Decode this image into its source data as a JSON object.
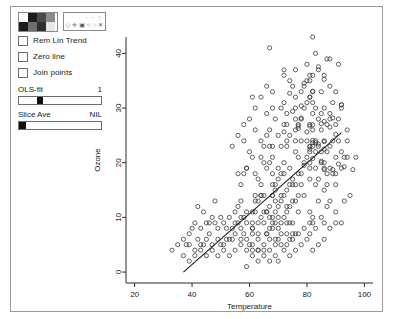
{
  "window": {
    "title": ""
  },
  "controls": {
    "color_palette": {
      "name": "color-palette",
      "swatches": [
        "#ffffff",
        "#1c1c1c",
        "#4a4a4a",
        "#8c8c8c",
        "#1c1c1c",
        "#6e6e6e",
        "#2f2f2f",
        "#e8e8e8"
      ]
    },
    "symbol_palette": {
      "name": "symbol-palette",
      "row_top": [
        "·",
        "·",
        "·",
        "+",
        "•",
        "◻"
      ],
      "row_bottom": [
        "◇",
        "✛",
        "▣",
        "○",
        "◌",
        "✕"
      ]
    },
    "checkboxes": [
      {
        "label": "Rem Lin Trend",
        "checked": false
      },
      {
        "label": "Zero line",
        "checked": false
      },
      {
        "label": "Join points",
        "checked": false
      }
    ],
    "sliders": [
      {
        "label": "OLS-fit",
        "value": "1",
        "fill_percent": 28
      },
      {
        "label": "Slice Ave",
        "value": "NIL",
        "fill_percent": 9
      }
    ]
  },
  "chart_data": {
    "type": "scatter",
    "title": "",
    "xlabel": "Temperature",
    "ylabel": "Ozone",
    "xlim": [
      17,
      103
    ],
    "ylim": [
      -2,
      43
    ],
    "xticks": [
      20,
      40,
      60,
      80,
      100
    ],
    "yticks": [
      0,
      10,
      20,
      30,
      40
    ],
    "grid": false,
    "legend": "none",
    "marker": "open-circle",
    "fit_line": {
      "name": "ols-fit-line",
      "x": [
        37,
        92
      ],
      "y": [
        0,
        25.5
      ]
    },
    "points": [
      [
        67,
        41
      ],
      [
        72,
        36
      ],
      [
        74,
        12
      ],
      [
        62,
        18
      ],
      [
        65,
        23
      ],
      [
        59,
        19
      ],
      [
        61,
        8
      ],
      [
        69,
        16
      ],
      [
        66,
        11
      ],
      [
        68,
        14
      ],
      [
        58,
        18
      ],
      [
        64,
        14
      ],
      [
        66,
        34
      ],
      [
        57,
        6
      ],
      [
        68,
        30
      ],
      [
        62,
        11
      ],
      [
        59,
        1
      ],
      [
        73,
        11
      ],
      [
        61,
        4
      ],
      [
        61,
        32
      ],
      [
        67,
        23
      ],
      [
        81,
        45
      ],
      [
        79,
        115
      ],
      [
        76,
        37
      ],
      [
        82,
        29
      ],
      [
        90,
        71
      ],
      [
        87,
        39
      ],
      [
        82,
        23
      ],
      [
        77,
        21
      ],
      [
        72,
        37
      ],
      [
        65,
        20
      ],
      [
        73,
        12
      ],
      [
        76,
        13
      ],
      [
        84,
        135
      ],
      [
        85,
        49
      ],
      [
        81,
        32
      ],
      [
        83,
        64
      ],
      [
        83,
        40
      ],
      [
        88,
        77
      ],
      [
        92,
        97
      ],
      [
        92,
        97
      ],
      [
        89,
        85
      ],
      [
        82,
        10
      ],
      [
        73,
        27
      ],
      [
        81,
        7
      ],
      [
        91,
        48
      ],
      [
        80,
        35
      ],
      [
        81,
        61
      ],
      [
        82,
        79
      ],
      [
        84,
        63
      ],
      [
        87,
        16
      ],
      [
        85,
        80
      ],
      [
        74,
        108
      ],
      [
        81,
        20
      ],
      [
        82,
        52
      ],
      [
        86,
        82
      ],
      [
        85,
        50
      ],
      [
        82,
        64
      ],
      [
        86,
        59
      ],
      [
        88,
        39
      ],
      [
        86,
        9
      ],
      [
        83,
        16
      ],
      [
        81,
        78
      ],
      [
        81,
        35
      ],
      [
        82,
        66
      ],
      [
        86,
        122
      ],
      [
        85,
        89
      ],
      [
        82,
        110
      ],
      [
        86,
        44
      ],
      [
        88,
        28
      ],
      [
        86,
        65
      ],
      [
        83,
        22
      ],
      [
        81,
        59
      ],
      [
        81,
        23
      ],
      [
        82,
        31
      ],
      [
        89,
        44
      ],
      [
        90,
        21
      ],
      [
        90,
        9
      ],
      [
        86,
        45
      ],
      [
        82,
        168
      ],
      [
        80,
        73
      ],
      [
        77,
        76
      ],
      [
        79,
        118
      ],
      [
        76,
        84
      ],
      [
        78,
        85
      ],
      [
        78,
        96
      ],
      [
        77,
        78
      ],
      [
        72,
        73
      ],
      [
        75,
        91
      ],
      [
        79,
        47
      ],
      [
        81,
        32
      ],
      [
        86,
        20
      ],
      [
        88,
        23
      ],
      [
        97,
        21
      ],
      [
        94,
        24
      ],
      [
        96,
        44
      ],
      [
        94,
        21
      ],
      [
        91,
        28
      ],
      [
        92,
        9
      ],
      [
        93,
        13
      ],
      [
        93,
        46
      ],
      [
        87,
        18
      ],
      [
        84,
        13
      ],
      [
        80,
        24
      ],
      [
        78,
        16
      ],
      [
        75,
        13
      ],
      [
        73,
        23
      ],
      [
        81,
        36
      ],
      [
        76,
        7
      ],
      [
        77,
        14
      ],
      [
        71,
        30
      ],
      [
        71,
        14
      ],
      [
        78,
        18
      ],
      [
        67,
        20
      ],
      [
        76,
        16
      ],
      [
        68,
        16
      ],
      [
        82,
        9
      ],
      [
        64,
        14
      ],
      [
        71,
        18
      ],
      [
        81,
        11
      ],
      [
        69,
        6
      ],
      [
        63,
        4
      ],
      [
        70,
        10
      ],
      [
        75,
        7
      ],
      [
        76,
        24
      ],
      [
        68,
        18
      ],
      [
        63,
        4
      ],
      [
        68,
        8
      ],
      [
        75,
        16
      ],
      [
        76,
        32
      ],
      [
        68,
        9
      ],
      [
        67,
        6
      ],
      [
        70,
        12
      ],
      [
        67,
        8
      ],
      [
        72,
        14
      ],
      [
        74,
        9
      ],
      [
        69,
        11
      ],
      [
        65,
        9
      ],
      [
        63,
        13
      ],
      [
        64,
        16
      ],
      [
        70,
        19
      ],
      [
        66,
        7
      ],
      [
        61,
        5
      ],
      [
        68,
        14
      ],
      [
        74,
        6
      ],
      [
        73,
        9
      ],
      [
        68,
        10
      ],
      [
        65,
        4
      ],
      [
        69,
        13
      ],
      [
        61,
        8
      ],
      [
        66,
        11
      ],
      [
        62,
        13
      ],
      [
        74,
        16
      ],
      [
        73,
        24
      ],
      [
        72,
        18
      ],
      [
        71,
        9
      ],
      [
        70,
        6
      ],
      [
        69,
        15
      ],
      [
        67,
        12
      ],
      [
        66,
        7
      ],
      [
        64,
        10
      ],
      [
        62,
        14
      ],
      [
        60,
        5
      ],
      [
        58,
        7
      ],
      [
        56,
        9
      ],
      [
        55,
        11
      ],
      [
        54,
        6
      ],
      [
        52,
        8
      ],
      [
        50,
        5
      ],
      [
        48,
        9
      ],
      [
        46,
        7
      ],
      [
        44,
        11
      ],
      [
        42,
        6
      ],
      [
        40,
        8
      ],
      [
        38,
        5
      ],
      [
        57,
        13
      ],
      [
        59,
        9
      ],
      [
        61,
        11
      ],
      [
        63,
        7
      ],
      [
        65,
        14
      ],
      [
        58,
        10
      ],
      [
        56,
        12
      ],
      [
        54,
        8
      ],
      [
        52,
        6
      ],
      [
        50,
        10
      ],
      [
        48,
        13
      ],
      [
        46,
        9
      ],
      [
        44,
        5
      ],
      [
        42,
        12
      ],
      [
        57,
        16
      ],
      [
        59,
        19
      ],
      [
        61,
        21
      ],
      [
        63,
        17
      ],
      [
        60,
        22
      ],
      [
        58,
        24
      ],
      [
        56,
        18
      ],
      [
        67,
        26
      ],
      [
        69,
        28
      ],
      [
        71,
        23
      ],
      [
        73,
        29
      ],
      [
        75,
        34
      ],
      [
        77,
        27
      ],
      [
        79,
        30
      ],
      [
        81,
        27
      ],
      [
        83,
        30
      ],
      [
        85,
        33
      ],
      [
        87,
        27
      ],
      [
        89,
        31
      ],
      [
        70,
        8
      ],
      [
        72,
        10
      ],
      [
        74,
        19
      ],
      [
        76,
        22
      ],
      [
        78,
        28
      ],
      [
        80,
        38
      ],
      [
        82,
        36
      ],
      [
        84,
        28
      ],
      [
        86,
        36
      ],
      [
        88,
        34
      ],
      [
        90,
        27
      ],
      [
        92,
        30
      ],
      [
        85,
        22
      ],
      [
        83,
        19
      ],
      [
        81,
        17
      ],
      [
        79,
        14
      ],
      [
        77,
        11
      ],
      [
        75,
        9
      ],
      [
        73,
        7
      ],
      [
        71,
        5
      ],
      [
        69,
        3
      ],
      [
        67,
        2
      ],
      [
        65,
        3
      ],
      [
        63,
        2
      ],
      [
        61,
        3
      ],
      [
        59,
        4
      ],
      [
        57,
        5
      ],
      [
        55,
        4
      ],
      [
        53,
        3
      ],
      [
        51,
        4
      ],
      [
        49,
        3
      ],
      [
        47,
        4
      ],
      [
        45,
        3
      ],
      [
        43,
        4
      ],
      [
        41,
        3
      ],
      [
        39,
        2
      ],
      [
        37,
        3
      ],
      [
        66,
        25
      ],
      [
        64,
        24
      ],
      [
        62,
        26
      ],
      [
        68,
        23
      ],
      [
        70,
        25
      ],
      [
        72,
        27
      ],
      [
        74,
        25
      ],
      [
        76,
        30
      ],
      [
        78,
        33
      ],
      [
        80,
        31
      ],
      [
        82,
        33
      ],
      [
        84,
        37
      ],
      [
        86,
        30
      ],
      [
        88,
        29
      ],
      [
        90,
        33
      ],
      [
        91,
        38
      ],
      [
        89,
        24
      ],
      [
        87,
        22
      ],
      [
        85,
        26
      ],
      [
        83,
        24
      ],
      [
        81,
        22
      ],
      [
        79,
        20
      ],
      [
        77,
        18
      ],
      [
        75,
        17
      ],
      [
        73,
        15
      ],
      [
        71,
        13
      ],
      [
        69,
        9
      ],
      [
        67,
        10
      ],
      [
        65,
        11
      ],
      [
        63,
        9
      ],
      [
        61,
        7
      ],
      [
        59,
        6
      ],
      [
        57,
        8
      ],
      [
        55,
        7
      ],
      [
        53,
        6
      ],
      [
        51,
        5
      ],
      [
        49,
        6
      ],
      [
        47,
        5
      ],
      [
        45,
        6
      ],
      [
        43,
        5
      ],
      [
        41,
        4
      ],
      [
        39,
        5
      ],
      [
        84,
        17
      ],
      [
        86,
        15
      ],
      [
        88,
        13
      ],
      [
        90,
        16
      ],
      [
        92,
        19
      ],
      [
        90,
        11
      ],
      [
        88,
        8
      ],
      [
        86,
        6
      ],
      [
        84,
        5
      ],
      [
        82,
        4
      ],
      [
        80,
        6
      ],
      [
        78,
        5
      ],
      [
        76,
        4
      ],
      [
        74,
        3
      ],
      [
        72,
        4
      ],
      [
        70,
        2
      ],
      [
        93,
        21
      ],
      [
        95,
        14
      ],
      [
        91,
        24
      ],
      [
        89,
        18
      ],
      [
        87,
        12
      ],
      [
        85,
        10
      ],
      [
        83,
        8
      ],
      [
        81,
        9
      ],
      [
        79,
        8
      ],
      [
        77,
        7
      ],
      [
        75,
        6
      ],
      [
        73,
        5
      ],
      [
        71,
        7
      ],
      [
        69,
        5
      ],
      [
        67,
        4
      ],
      [
        65,
        5
      ],
      [
        63,
        6
      ],
      [
        61,
        9
      ],
      [
        59,
        11
      ],
      [
        57,
        10
      ],
      [
        55,
        9
      ],
      [
        53,
        10
      ],
      [
        51,
        9
      ],
      [
        49,
        8
      ],
      [
        47,
        10
      ],
      [
        45,
        9
      ],
      [
        43,
        8
      ],
      [
        41,
        9
      ],
      [
        39,
        7
      ],
      [
        37,
        6
      ],
      [
        35,
        5
      ],
      [
        33,
        4
      ],
      [
        60,
        28
      ],
      [
        62,
        30
      ],
      [
        64,
        32
      ],
      [
        58,
        27
      ],
      [
        56,
        25
      ],
      [
        54,
        23
      ],
      [
        66,
        29
      ],
      [
        68,
        33
      ],
      [
        72,
        31
      ],
      [
        74,
        35
      ],
      [
        64,
        21
      ],
      [
        66,
        19
      ],
      [
        68,
        21
      ],
      [
        70,
        17
      ],
      [
        72,
        20
      ],
      [
        76,
        26
      ],
      [
        78,
        24
      ],
      [
        80,
        21
      ],
      [
        82,
        26
      ],
      [
        84,
        23
      ],
      [
        86,
        24
      ],
      [
        88,
        19
      ],
      [
        90,
        18
      ],
      [
        92,
        22
      ],
      [
        94,
        26
      ]
    ]
  }
}
